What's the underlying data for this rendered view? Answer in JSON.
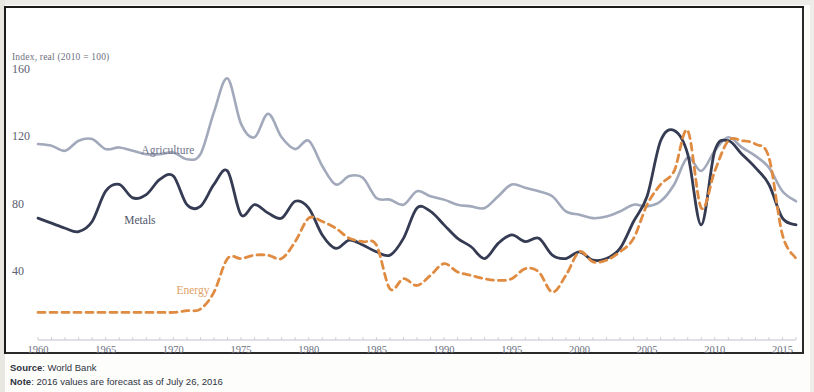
{
  "figure": {
    "y_axis_caption": "Index, real (2010 = 100)",
    "source_label": "Source",
    "source_value": ": World Bank",
    "note_label": "Note",
    "note_value": ": 2016 values are forecast as of July 26, 2016"
  },
  "series_labels": {
    "agriculture": "Agriculture",
    "metals": "Metals",
    "energy": "Energy"
  },
  "colors": {
    "agriculture": "#9aa2b5",
    "metals": "#343b52",
    "energy": "#e08b42",
    "frame": "#2a2a2a",
    "tick_text": "#6a6f7e"
  },
  "chart_data": {
    "type": "line",
    "title": "",
    "subtitle": "",
    "xlabel": "",
    "ylabel": "Index, real (2010 = 100)",
    "xlim": [
      1960,
      2016
    ],
    "ylim": [
      0,
      170
    ],
    "yticks": [
      40,
      80,
      120,
      160
    ],
    "xticks": [
      1960,
      1965,
      1970,
      1975,
      1980,
      1985,
      1990,
      1995,
      2000,
      2005,
      2010,
      2015
    ],
    "grid": false,
    "legend": "inline-labels",
    "x": [
      1960,
      1961,
      1962,
      1963,
      1964,
      1965,
      1966,
      1967,
      1968,
      1969,
      1970,
      1971,
      1972,
      1973,
      1974,
      1975,
      1976,
      1977,
      1978,
      1979,
      1980,
      1981,
      1982,
      1983,
      1984,
      1985,
      1986,
      1987,
      1988,
      1989,
      1990,
      1991,
      1992,
      1993,
      1994,
      1995,
      1996,
      1997,
      1998,
      1999,
      2000,
      2001,
      2002,
      2003,
      2004,
      2005,
      2006,
      2007,
      2008,
      2009,
      2010,
      2011,
      2012,
      2013,
      2014,
      2015,
      2016
    ],
    "series": [
      {
        "name": "Agriculture",
        "color": "#9aa2b5",
        "style": "solid",
        "values": [
          116,
          115,
          112,
          118,
          119,
          113,
          114,
          112,
          110,
          110,
          111,
          107,
          110,
          135,
          155,
          128,
          120,
          134,
          120,
          113,
          118,
          103,
          92,
          97,
          96,
          84,
          83,
          80,
          88,
          85,
          83,
          80,
          79,
          78,
          85,
          92,
          90,
          88,
          85,
          76,
          74,
          72,
          73,
          76,
          80,
          79,
          82,
          92,
          108,
          100,
          112,
          120,
          114,
          109,
          102,
          88,
          82
        ]
      },
      {
        "name": "Metals",
        "color": "#343b52",
        "style": "solid",
        "values": [
          72,
          69,
          66,
          64,
          70,
          88,
          92,
          84,
          86,
          95,
          97,
          80,
          79,
          92,
          100,
          74,
          80,
          75,
          72,
          82,
          78,
          62,
          54,
          59,
          56,
          52,
          50,
          60,
          78,
          76,
          68,
          60,
          55,
          48,
          57,
          62,
          58,
          60,
          50,
          48,
          52,
          47,
          48,
          54,
          70,
          85,
          118,
          124,
          110,
          68,
          112,
          118,
          110,
          102,
          92,
          72,
          68
        ]
      },
      {
        "name": "Energy",
        "color": "#e08b42",
        "style": "dashed",
        "values": [
          16,
          16,
          16,
          16,
          16,
          16,
          16,
          16,
          16,
          16,
          16,
          17,
          18,
          28,
          48,
          48,
          50,
          50,
          48,
          58,
          72,
          70,
          66,
          60,
          58,
          56,
          30,
          36,
          32,
          38,
          45,
          40,
          38,
          36,
          35,
          36,
          42,
          40,
          28,
          38,
          52,
          46,
          47,
          52,
          60,
          80,
          92,
          100,
          124,
          78,
          100,
          118,
          118,
          116,
          108,
          62,
          48
        ]
      }
    ]
  }
}
